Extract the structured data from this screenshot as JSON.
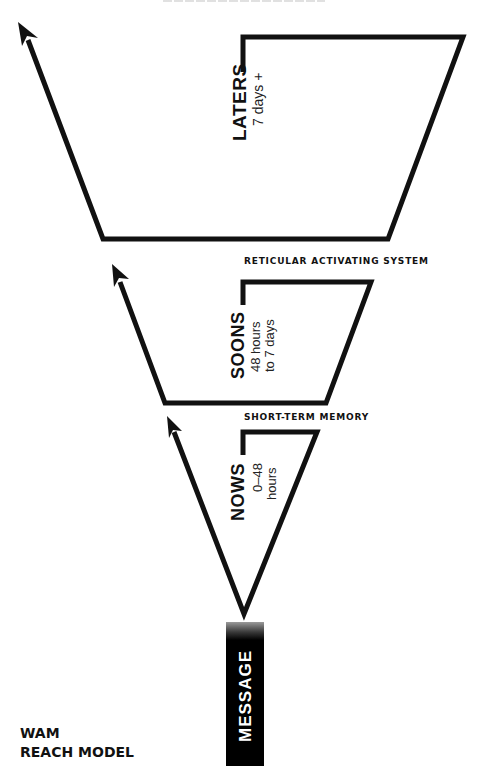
{
  "diagram": {
    "title_line1": "WAM",
    "title_line2": "REACH MODEL",
    "stages": [
      {
        "name": "LATERS",
        "range_line1": "7 days +",
        "range_line2": ""
      },
      {
        "name": "SOONS",
        "range_line1": "48 hours",
        "range_line2": "to 7 days"
      },
      {
        "name": "NOWS",
        "range_line1": "0–48",
        "range_line2": "hours"
      }
    ],
    "thresholds": [
      {
        "label": "RETICULAR ACTIVATING SYSTEM"
      },
      {
        "label": "SHORT-TERM MEMORY"
      }
    ],
    "source": {
      "label": "MESSAGE"
    },
    "colors": {
      "stroke": "#111111",
      "background": "#ffffff",
      "message_fill": "#000000"
    }
  }
}
